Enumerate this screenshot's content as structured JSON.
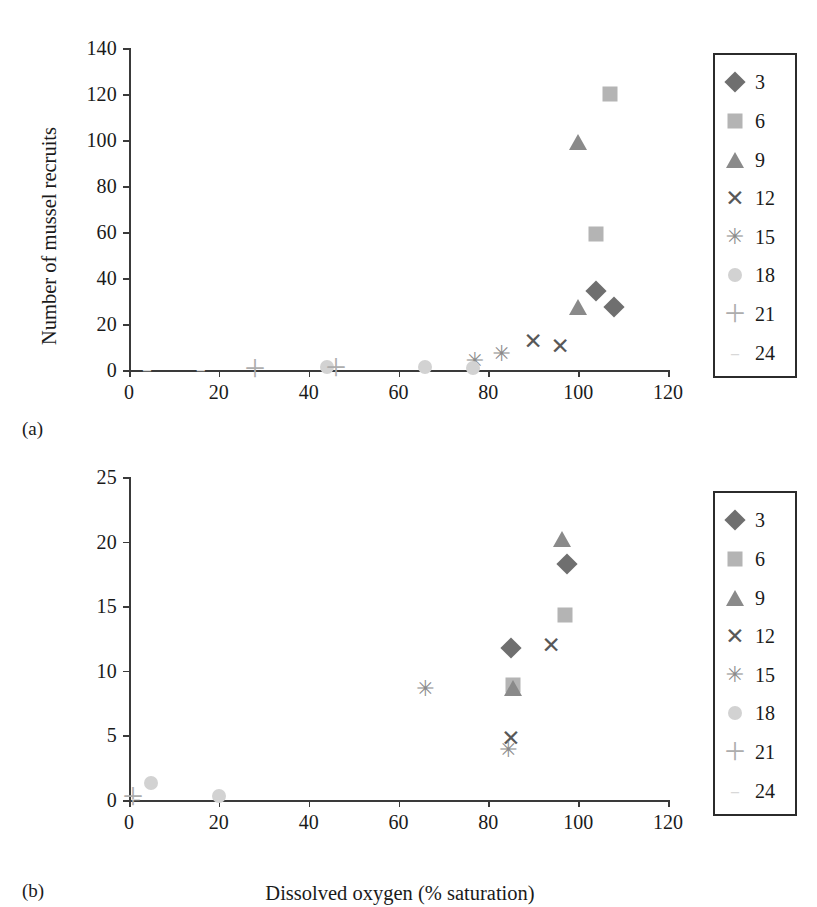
{
  "figure": {
    "xlabel": "Dissolved oxygen (% saturation)",
    "caption_a": "(a)",
    "caption_b": "(b)"
  },
  "legend": {
    "entries": [
      {
        "label": "3",
        "marker": "diamond",
        "color": "#6f6f6f"
      },
      {
        "label": "6",
        "marker": "square",
        "color": "#b4b4b4"
      },
      {
        "label": "9",
        "marker": "triangle",
        "color": "#8a8a8a"
      },
      {
        "label": "12",
        "marker": "x",
        "color": "#585858"
      },
      {
        "label": "15",
        "marker": "star",
        "color": "#8b8b8b"
      },
      {
        "label": "18",
        "marker": "circle",
        "color": "#d2d2d2"
      },
      {
        "label": "21",
        "marker": "plus",
        "color": "#adadad"
      },
      {
        "label": "24",
        "marker": "dash",
        "color": "#d8d8d8"
      }
    ]
  },
  "chart_data": [
    {
      "panel": "a",
      "type": "scatter",
      "title": "",
      "xlabel": "",
      "ylabel": "Number of mussel recruits",
      "xlim": [
        0,
        120
      ],
      "ylim": [
        0,
        140
      ],
      "xticks": [
        0,
        20,
        40,
        60,
        80,
        100,
        120
      ],
      "yticks": [
        0,
        20,
        40,
        60,
        80,
        100,
        120,
        140
      ],
      "grid": false,
      "legend_position": "right",
      "series": [
        {
          "name": "3",
          "marker": "diamond",
          "points": [
            [
              104,
              34.5
            ],
            [
              108,
              27.5
            ]
          ]
        },
        {
          "name": "6",
          "marker": "square",
          "points": [
            [
              107,
              120
            ],
            [
              104,
              59
            ]
          ]
        },
        {
          "name": "9",
          "marker": "triangle",
          "points": [
            [
              100,
              99
            ],
            [
              100,
              27.5
            ]
          ]
        },
        {
          "name": "12",
          "marker": "x",
          "points": [
            [
              90,
              12.5
            ],
            [
              96,
              10.5
            ]
          ]
        },
        {
          "name": "15",
          "marker": "star",
          "points": [
            [
              83,
              7
            ],
            [
              77,
              4
            ]
          ]
        },
        {
          "name": "18",
          "marker": "circle",
          "points": [
            [
              44,
              1.5
            ],
            [
              66,
              1.5
            ],
            [
              76.5,
              1
            ]
          ]
        },
        {
          "name": "21",
          "marker": "plus",
          "points": [
            [
              28,
              0.5
            ],
            [
              46,
              1
            ]
          ]
        },
        {
          "name": "24",
          "marker": "dash",
          "points": [
            [
              4,
              0.5
            ],
            [
              16,
              0.5
            ]
          ]
        }
      ]
    },
    {
      "panel": "b",
      "type": "scatter",
      "title": "",
      "xlabel": "Dissolved oxygen (% saturation)",
      "ylabel": "",
      "xlim": [
        0,
        120
      ],
      "ylim": [
        0,
        25
      ],
      "xticks": [
        0,
        20,
        40,
        60,
        80,
        100,
        120
      ],
      "yticks": [
        0,
        5,
        10,
        15,
        20,
        25
      ],
      "grid": false,
      "legend_position": "right",
      "series": [
        {
          "name": "3",
          "marker": "diamond",
          "points": [
            [
              97.5,
              18.3
            ],
            [
              85,
              11.8
            ]
          ]
        },
        {
          "name": "6",
          "marker": "square",
          "points": [
            [
              97,
              14.3
            ],
            [
              85.5,
              8.9
            ]
          ]
        },
        {
          "name": "9",
          "marker": "triangle",
          "points": [
            [
              96.5,
              20.2
            ],
            [
              85.5,
              8.7
            ]
          ]
        },
        {
          "name": "12",
          "marker": "x",
          "points": [
            [
              94,
              12.0
            ],
            [
              85,
              4.8
            ]
          ]
        },
        {
          "name": "15",
          "marker": "star",
          "points": [
            [
              66,
              8.6
            ],
            [
              84.5,
              3.9
            ]
          ]
        },
        {
          "name": "18",
          "marker": "circle",
          "points": [
            [
              5,
              1.3
            ],
            [
              20,
              0.3
            ]
          ]
        },
        {
          "name": "21",
          "marker": "plus",
          "points": [
            [
              1,
              0.2
            ]
          ]
        },
        {
          "name": "24",
          "marker": "dash",
          "points": [
            [
              1.5,
              0.15
            ]
          ]
        }
      ]
    }
  ]
}
